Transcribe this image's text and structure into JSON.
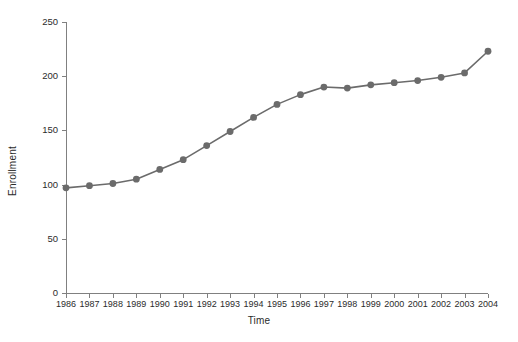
{
  "chart_data": {
    "type": "line",
    "title": "",
    "xlabel": "Time",
    "ylabel": "Enrollment",
    "categories": [
      1986,
      1987,
      1988,
      1989,
      1990,
      1991,
      1992,
      1993,
      1994,
      1995,
      1996,
      1997,
      1998,
      1999,
      2000,
      2001,
      2002,
      2003,
      2004
    ],
    "x_tick_labels": [
      "1986",
      "1987",
      "1988",
      "1989",
      "1990",
      "1991",
      "1992",
      "1993",
      "1994",
      "1995",
      "1996",
      "1997",
      "1998",
      "1999",
      "2000",
      "2001",
      "2002",
      "2003",
      "2004"
    ],
    "values": [
      97,
      99,
      101,
      105,
      114,
      123,
      136,
      149,
      162,
      174,
      183,
      190,
      189,
      192,
      194,
      196,
      199,
      203,
      223
    ],
    "y_tick_labels": [
      "0",
      "50",
      "100",
      "150",
      "200",
      "250"
    ],
    "y_ticks": [
      0,
      50,
      100,
      150,
      200,
      250
    ],
    "ylim": [
      0,
      250
    ],
    "xlim": [
      1986,
      2004
    ],
    "grid": false,
    "legend": false,
    "legend_position": "none",
    "marker": "circle",
    "line_color": "#6b6b6b",
    "marker_color": "#6b6b6b",
    "axis_color": "#808080",
    "background": "#ffffff"
  }
}
